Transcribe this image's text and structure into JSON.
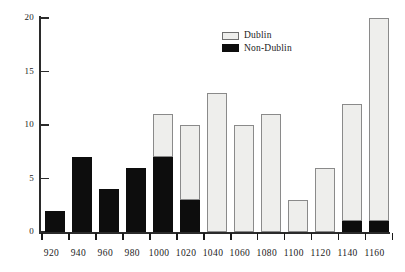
{
  "chart_data": {
    "type": "bar",
    "stacked": true,
    "title": "",
    "subtitle": "",
    "xlabel": "",
    "ylabel": "",
    "categories": [
      "920",
      "940",
      "960",
      "980",
      "1000",
      "1020",
      "1040",
      "1060",
      "1080",
      "1100",
      "1120",
      "1140",
      "1160"
    ],
    "series": [
      {
        "name": "Non-Dublin",
        "color": "#0d0d0d",
        "values": [
          2,
          7,
          4,
          6,
          7,
          3,
          0,
          0,
          0,
          0,
          0,
          1,
          1
        ]
      },
      {
        "name": "Dublin",
        "color": "#eeeeec",
        "values": [
          0,
          0,
          0,
          0,
          4,
          7,
          13,
          10,
          11,
          3,
          6,
          11,
          19
        ]
      }
    ],
    "totals": [
      2,
      7,
      4,
      6,
      11,
      10,
      13,
      10,
      11,
      3,
      6,
      12,
      20
    ],
    "ylim": [
      0,
      20
    ],
    "yticks": [
      0,
      5,
      10,
      15,
      20
    ],
    "ytick_labels": [
      "0",
      "5",
      "10",
      "15",
      "20"
    ],
    "grid": false,
    "legend_position": "top-right",
    "legend": [
      {
        "label": "Dublin",
        "swatch": "dublin"
      },
      {
        "label": "Non-Dublin",
        "swatch": "nondublin"
      }
    ]
  }
}
